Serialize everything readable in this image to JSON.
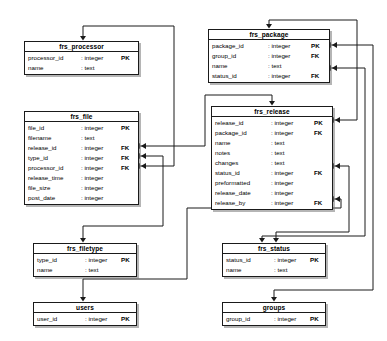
{
  "diagram": {
    "type": "er-diagram",
    "colors": {
      "line": "#1a1a1a",
      "box_fill": "#ffffff",
      "text": "#000000",
      "shadow": "#787878"
    }
  },
  "tables": [
    {
      "id": "frs_processor",
      "name": "frs_processor",
      "x": 24,
      "y": 41,
      "w": 115,
      "columns": [
        {
          "name": "processor_id",
          "type": ": integer",
          "key": "PK"
        },
        {
          "name": "name",
          "type": ": text",
          "key": ""
        }
      ]
    },
    {
      "id": "frs_package",
      "name": "frs_package",
      "x": 208,
      "y": 29,
      "w": 122,
      "columns": [
        {
          "name": "package_id",
          "type": ": integer",
          "key": "PK"
        },
        {
          "name": "group_id",
          "type": ": integer",
          "key": "FK"
        },
        {
          "name": "name",
          "type": ": text",
          "key": ""
        },
        {
          "name": "status_id",
          "type": ": integer",
          "key": "FK"
        }
      ]
    },
    {
      "id": "frs_file",
      "name": "frs_file",
      "x": 24,
      "y": 111,
      "w": 115,
      "columns": [
        {
          "name": "file_id",
          "type": ": integer",
          "key": "PK"
        },
        {
          "name": "filename",
          "type": ": text",
          "key": ""
        },
        {
          "name": "release_id",
          "type": ": integer",
          "key": "FK"
        },
        {
          "name": "type_id",
          "type": ": integer",
          "key": "FK"
        },
        {
          "name": "processor_id",
          "type": ": integer",
          "key": "FK"
        },
        {
          "name": "release_time",
          "type": ": integer",
          "key": ""
        },
        {
          "name": "file_size",
          "type": ": integer",
          "key": ""
        },
        {
          "name": "post_date",
          "type": ": integer",
          "key": ""
        }
      ]
    },
    {
      "id": "frs_release",
      "name": "frs_release",
      "x": 211,
      "y": 106,
      "w": 122,
      "columns": [
        {
          "name": "release_id",
          "type": ": integer",
          "key": "PK"
        },
        {
          "name": "package_id",
          "type": ": integer",
          "key": "FK"
        },
        {
          "name": "name",
          "type": ": text",
          "key": ""
        },
        {
          "name": "notes",
          "type": ": text",
          "key": ""
        },
        {
          "name": "changes",
          "type": ": text",
          "key": ""
        },
        {
          "name": "status_id",
          "type": ": integer",
          "key": "FK"
        },
        {
          "name": "preformatted",
          "type": ": integer",
          "key": ""
        },
        {
          "name": "release_date",
          "type": ": integer",
          "key": ""
        },
        {
          "name": "release_by",
          "type": ": integer",
          "key": "FK"
        }
      ]
    },
    {
      "id": "frs_filetype",
      "name": "frs_filetype",
      "x": 33,
      "y": 243,
      "w": 104,
      "columns": [
        {
          "name": "type_id",
          "type": ": integer",
          "key": "PK"
        },
        {
          "name": "name",
          "type": ": text",
          "key": ""
        }
      ]
    },
    {
      "id": "frs_status",
      "name": "frs_status",
      "x": 222,
      "y": 243,
      "w": 104,
      "columns": [
        {
          "name": "status_id",
          "type": ": integer",
          "key": "PK"
        },
        {
          "name": "name",
          "type": ": text",
          "key": ""
        }
      ]
    },
    {
      "id": "users",
      "name": "users",
      "x": 33,
      "y": 302,
      "w": 104,
      "columns": [
        {
          "name": "user_id",
          "type": ": integer",
          "key": "PK"
        }
      ]
    },
    {
      "id": "groups",
      "name": "groups",
      "x": 222,
      "y": 302,
      "w": 104,
      "columns": [
        {
          "name": "group_id",
          "type": ": integer",
          "key": "PK"
        }
      ]
    }
  ],
  "relationships": [
    {
      "id": "file-processor",
      "from": "frs_file.processor_id",
      "to": "frs_processor",
      "path": "M139,166 L174,166 L174,26 L83,26 L83,38"
    },
    {
      "id": "file-filetype",
      "from": "frs_file.type_id",
      "to": "frs_filetype",
      "path": "M139,156 L163,156 L163,226 L83,226 L83,240"
    },
    {
      "id": "file-release",
      "from": "frs_release",
      "to": "frs_file.release_id",
      "path": "M139,146 L205,146 L205,95 L272,95 L272,103"
    },
    {
      "id": "release-package",
      "from": "frs_release.package_id",
      "to": "frs_package",
      "path": "M333,120 L357,120 L357,20 L269,20 L269,26"
    },
    {
      "id": "package-group",
      "from": "frs_package.group_id",
      "to": "groups",
      "path": "M330,45 L373,45 L373,290 L274,290 L274,299"
    },
    {
      "id": "package-status",
      "from": "frs_package.status_id",
      "to": "frs_status",
      "path": "M330,68 L365,68 L365,236 L262,236 L262,240"
    },
    {
      "id": "release-status",
      "from": "frs_release.status_id",
      "to": "frs_status",
      "path": "M333,166 L349,166 L349,232 L276,232 L276,240"
    },
    {
      "id": "release-users",
      "from": "frs_release.release_by",
      "to": "users",
      "path": "M333,199 L341,199 L341,208 L187,208 L187,279 L83,279 L83,299"
    }
  ],
  "arrow_marks": [
    {
      "at": "frs_processor-top",
      "dir": "down",
      "x": 83,
      "y": 41
    },
    {
      "at": "frs_package-top",
      "dir": "down",
      "x": 269,
      "y": 29
    },
    {
      "at": "frs_release-top",
      "dir": "down",
      "x": 272,
      "y": 106
    },
    {
      "at": "frs_filetype-top",
      "dir": "down",
      "x": 83,
      "y": 243
    },
    {
      "at": "frs_status-top-left",
      "dir": "down",
      "x": 262,
      "y": 243
    },
    {
      "at": "frs_status-top-right",
      "dir": "down",
      "x": 276,
      "y": 243
    },
    {
      "at": "users-top",
      "dir": "down",
      "x": 83,
      "y": 302
    },
    {
      "at": "groups-top",
      "dir": "down",
      "x": 274,
      "y": 302
    },
    {
      "at": "frs_file-release_id",
      "dir": "left",
      "x": 139,
      "y": 146
    },
    {
      "at": "frs_file-type_id",
      "dir": "left",
      "x": 139,
      "y": 156
    },
    {
      "at": "frs_file-processor_id",
      "dir": "left",
      "x": 139,
      "y": 166
    },
    {
      "at": "frs_package-group_id",
      "dir": "left",
      "x": 330,
      "y": 45
    },
    {
      "at": "frs_package-status_id",
      "dir": "left",
      "x": 330,
      "y": 68
    },
    {
      "at": "frs_release-package_id",
      "dir": "left",
      "x": 333,
      "y": 120
    },
    {
      "at": "frs_release-status_id",
      "dir": "left",
      "x": 333,
      "y": 166
    },
    {
      "at": "frs_release-release_by",
      "dir": "left",
      "x": 333,
      "y": 199
    }
  ]
}
